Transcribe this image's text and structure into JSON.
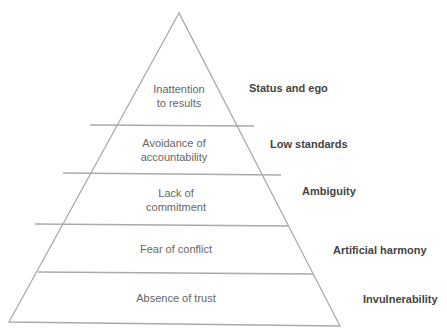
{
  "diagram": {
    "type": "pyramid",
    "levels": [
      {
        "text_line1": "Inattention",
        "text_line2": "to results",
        "label": "Status and ego"
      },
      {
        "text_line1": "Avoidance of",
        "text_line2": "accountability",
        "label": "Low standards"
      },
      {
        "text_line1": "Lack of",
        "text_line2": "commitment",
        "label": "Ambiguity"
      },
      {
        "text_line1": "Fear of conflict",
        "text_line2": "",
        "label": "Artificial harmony"
      },
      {
        "text_line1": "Absence of trust",
        "text_line2": "",
        "label": "Invulnerability"
      }
    ],
    "colors": {
      "line": "#aaaaaa",
      "text": "#666666",
      "label": "#444444"
    }
  }
}
